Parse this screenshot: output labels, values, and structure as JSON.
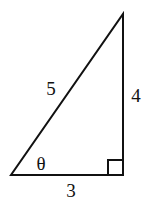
{
  "diagram": {
    "type": "right-triangle",
    "vertices": {
      "bottom_left": [
        11,
        175
      ],
      "bottom_right": [
        123,
        175
      ],
      "top": [
        123,
        14
      ]
    },
    "right_angle_marker": {
      "x": 108,
      "y": 160,
      "size": 15
    },
    "labels": {
      "hypotenuse": "5",
      "vertical_leg": "4",
      "horizontal_leg": "3",
      "angle": "θ"
    },
    "colors": {
      "stroke": "#111111",
      "background": "#ffffff"
    }
  }
}
